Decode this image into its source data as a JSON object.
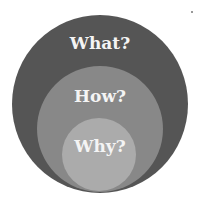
{
  "diagram": {
    "type": "nested-circles",
    "colors": {
      "background": "#ffffff",
      "outer": "#555555",
      "middle": "#888888",
      "inner": "#ababab",
      "text": "#f4f4f4"
    },
    "circles": [
      {
        "id": "outer",
        "label": "What?"
      },
      {
        "id": "middle",
        "label": "How?"
      },
      {
        "id": "inner",
        "label": "Why?"
      }
    ]
  }
}
